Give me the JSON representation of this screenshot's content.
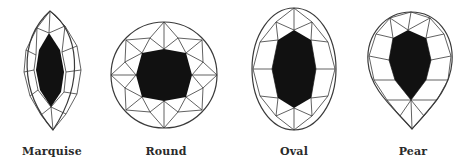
{
  "figure": {
    "shapes": [
      {
        "id": "marquise",
        "label": "Marquise",
        "label_x": 52
      },
      {
        "id": "round",
        "label": "Round",
        "label_x": 166
      },
      {
        "id": "oval",
        "label": "Oval",
        "label_x": 294
      },
      {
        "id": "pear",
        "label": "Pear",
        "label_x": 413
      }
    ]
  },
  "colors": {
    "background": "#ffffff",
    "outline": "#3a3a3a",
    "table_fill": "#111111",
    "label": "#2a2a2a"
  }
}
